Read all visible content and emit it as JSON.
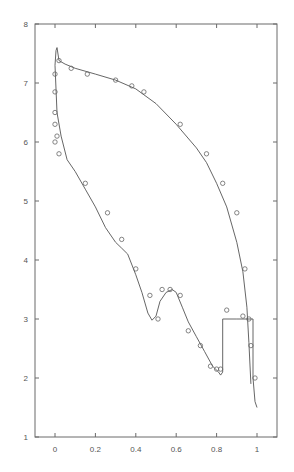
{
  "chart_data": {
    "type": "line",
    "title": "",
    "xlabel": "",
    "ylabel": "",
    "xlim": [
      -0.1,
      1.1
    ],
    "ylim": [
      1,
      8
    ],
    "grid": false,
    "legend": null,
    "xticks": [
      0,
      0.2,
      0.4,
      0.6,
      0.8,
      1
    ],
    "xtick_labels": [
      "0",
      "0.2",
      "0.4",
      "0.6",
      "0.8",
      "1"
    ],
    "yticks": [
      1,
      2,
      3,
      4,
      5,
      6,
      7,
      8
    ],
    "ytick_labels": [
      "1",
      "2",
      "3",
      "4",
      "5",
      "6",
      "7",
      "8"
    ],
    "series": [
      {
        "name": "upper curve (line)",
        "style": "line",
        "x": [
          0.0,
          0.005,
          0.01,
          0.02,
          0.05,
          0.1,
          0.2,
          0.3,
          0.4,
          0.5,
          0.6,
          0.7,
          0.75,
          0.8,
          0.85,
          0.9,
          0.93,
          0.95,
          0.96,
          0.97
        ],
        "y": [
          7.3,
          7.55,
          7.6,
          7.38,
          7.32,
          7.25,
          7.15,
          7.05,
          6.9,
          6.65,
          6.3,
          5.9,
          5.65,
          5.3,
          4.9,
          4.3,
          3.8,
          3.2,
          2.6,
          1.9
        ]
      },
      {
        "name": "lower curve (line)",
        "style": "line",
        "x": [
          0.0,
          0.01,
          0.03,
          0.06,
          0.1,
          0.15,
          0.2,
          0.25,
          0.3,
          0.33,
          0.36,
          0.4,
          0.43,
          0.46,
          0.48,
          0.5,
          0.52,
          0.55,
          0.58,
          0.6,
          0.63,
          0.66,
          0.7,
          0.74,
          0.78,
          0.81,
          0.82,
          0.83,
          0.83,
          0.9,
          0.98,
          0.98,
          0.99,
          1.0
        ],
        "y": [
          7.3,
          6.5,
          6.1,
          5.7,
          5.5,
          5.2,
          4.9,
          4.55,
          4.3,
          4.2,
          4.1,
          3.75,
          3.45,
          3.1,
          2.98,
          3.05,
          3.3,
          3.45,
          3.5,
          3.45,
          3.2,
          2.95,
          2.7,
          2.45,
          2.2,
          2.1,
          2.05,
          2.1,
          3.0,
          3.0,
          3.0,
          2.0,
          1.6,
          1.5
        ]
      },
      {
        "name": "upper markers",
        "style": "markers",
        "marker": "circle",
        "x": [
          0.0,
          0.0,
          0.02,
          0.08,
          0.16,
          0.3,
          0.38,
          0.44,
          0.62,
          0.75,
          0.83,
          0.9,
          0.94
        ],
        "y": [
          6.85,
          7.15,
          7.38,
          7.25,
          7.15,
          7.05,
          6.95,
          6.85,
          6.3,
          5.8,
          5.3,
          4.8,
          3.85
        ]
      },
      {
        "name": "lower markers",
        "style": "markers",
        "marker": "circle",
        "x": [
          0.0,
          0.0,
          0.01,
          0.0,
          0.02,
          0.15,
          0.26,
          0.33,
          0.4,
          0.47,
          0.51,
          0.53,
          0.57,
          0.62,
          0.66,
          0.72,
          0.77,
          0.8,
          0.82,
          0.85,
          0.93,
          0.96,
          0.97,
          0.99
        ],
        "y": [
          6.5,
          6.3,
          6.1,
          6.0,
          5.8,
          5.3,
          4.8,
          4.35,
          3.85,
          3.4,
          3.0,
          3.5,
          3.5,
          3.4,
          2.8,
          2.55,
          2.2,
          2.15,
          2.15,
          3.15,
          3.05,
          3.0,
          2.55,
          2.0
        ]
      }
    ]
  }
}
